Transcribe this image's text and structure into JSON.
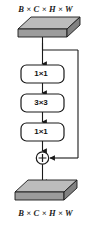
{
  "diagram": {
    "colors": {
      "slab_top_face": "#b9b9b9",
      "slab_front_face": "#9a9a9a",
      "slab_side_face": "#808080",
      "stroke": "#1a1a1a",
      "box_fill": "#ffffff",
      "background": "#ffffff"
    },
    "input_tensor": {
      "label": "B × C × H × W",
      "shape": "cuboid-slab"
    },
    "output_tensor": {
      "label": "B × C × H × W",
      "shape": "cuboid-slab"
    },
    "operations": [
      {
        "id": "conv1",
        "label": "1×1"
      },
      {
        "id": "conv2",
        "label": "3×3"
      },
      {
        "id": "conv3",
        "label": "1×1"
      }
    ],
    "merge_node": {
      "label": "+",
      "symbol": "circled-plus"
    },
    "skip_connection": {
      "label": ""
    }
  }
}
